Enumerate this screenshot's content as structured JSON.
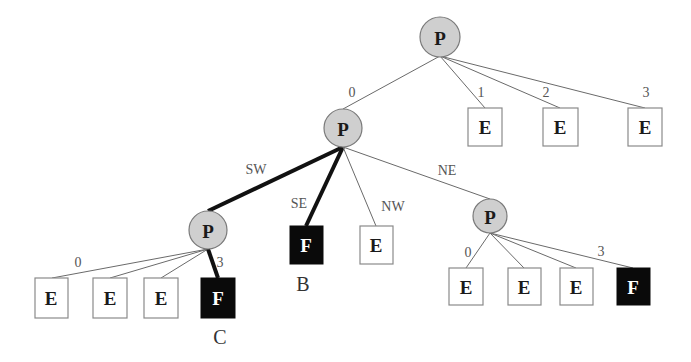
{
  "diagram": {
    "type": "quadtree",
    "colors": {
      "p_fill": "#cfcfcf",
      "e_fill": "#ffffff",
      "f_fill": "#0a0a0a",
      "bold_edge": "#111111",
      "thin_edge": "#6a6a6a"
    },
    "nodes": {
      "root": {
        "label": "P",
        "kind": "partial"
      },
      "r1": {
        "label": "E",
        "kind": "empty"
      },
      "r2": {
        "label": "E",
        "kind": "empty"
      },
      "r3": {
        "label": "E",
        "kind": "empty"
      },
      "n0": {
        "label": "P",
        "kind": "partial"
      },
      "sw": {
        "label": "P",
        "kind": "partial"
      },
      "se": {
        "label": "F",
        "kind": "full",
        "name": "B"
      },
      "nw": {
        "label": "E",
        "kind": "empty"
      },
      "ne": {
        "label": "P",
        "kind": "partial"
      },
      "sw0": {
        "label": "E",
        "kind": "empty"
      },
      "sw1": {
        "label": "E",
        "kind": "empty"
      },
      "sw2": {
        "label": "E",
        "kind": "empty"
      },
      "sw3": {
        "label": "F",
        "kind": "full",
        "name": "C"
      },
      "ne0": {
        "label": "E",
        "kind": "empty"
      },
      "ne1": {
        "label": "E",
        "kind": "empty"
      },
      "ne2": {
        "label": "E",
        "kind": "empty"
      },
      "ne3": {
        "label": "F",
        "kind": "full"
      }
    },
    "edge_labels": {
      "root_0": "0",
      "root_1": "1",
      "root_2": "2",
      "root_3": "3",
      "n0_sw": "SW",
      "n0_se": "SE",
      "n0_nw": "NW",
      "n0_ne": "NE",
      "sw_0": "0",
      "sw_3": "3",
      "ne_0": "0",
      "ne_3": "3"
    },
    "highlighted_path": [
      "n0-sw",
      "n0-se",
      "sw-sw3"
    ]
  }
}
